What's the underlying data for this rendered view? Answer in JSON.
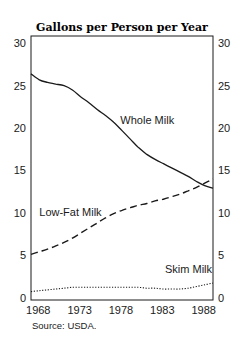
{
  "chart_data": {
    "type": "line",
    "title": "Gallons per Person per Year",
    "xlabel": "",
    "ylabel": "",
    "xlim": [
      1967,
      1989
    ],
    "ylim": [
      0,
      30
    ],
    "x_ticks": [
      1968,
      1973,
      1978,
      1983,
      1988
    ],
    "y_ticks": [
      0,
      5,
      10,
      15,
      20,
      25,
      30
    ],
    "y_axis_right_mirror": true,
    "grid": false,
    "legend": "inline annotations",
    "x": [
      1967,
      1968,
      1969,
      1970,
      1971,
      1972,
      1973,
      1974,
      1975,
      1976,
      1977,
      1978,
      1979,
      1980,
      1981,
      1982,
      1983,
      1984,
      1985,
      1986,
      1987,
      1988,
      1989
    ],
    "series": [
      {
        "name": "Whole Milk",
        "style": "solid",
        "values": [
          26.4,
          25.7,
          25.4,
          25.2,
          25.0,
          24.5,
          23.7,
          23.0,
          22.2,
          21.5,
          20.7,
          19.7,
          18.7,
          17.7,
          16.9,
          16.3,
          15.8,
          15.3,
          14.8,
          14.3,
          13.7,
          13.2,
          12.9
        ]
      },
      {
        "name": "Low-Fat Milk",
        "style": "dashed",
        "values": [
          5.1,
          5.4,
          5.7,
          6.1,
          6.5,
          7.0,
          7.6,
          8.2,
          8.8,
          9.4,
          9.9,
          10.3,
          10.6,
          10.9,
          11.1,
          11.4,
          11.6,
          11.9,
          12.2,
          12.6,
          13.0,
          13.5,
          14.0
        ]
      },
      {
        "name": "Skim Milk",
        "style": "dotted",
        "values": [
          0.7,
          0.8,
          0.9,
          1.0,
          1.1,
          1.2,
          1.2,
          1.2,
          1.2,
          1.2,
          1.2,
          1.2,
          1.2,
          1.2,
          1.1,
          1.1,
          1.0,
          1.0,
          1.0,
          1.1,
          1.3,
          1.5,
          1.7
        ]
      }
    ],
    "annotations": [
      {
        "text": "Whole Milk",
        "x": 1977.8,
        "y": 20.5
      },
      {
        "text": "Low-Fat Milk",
        "x": 1968,
        "y": 9.6
      },
      {
        "text": "Skim Milk",
        "x": 1983.2,
        "y": 2.9
      }
    ],
    "source": "Source: USDA."
  }
}
